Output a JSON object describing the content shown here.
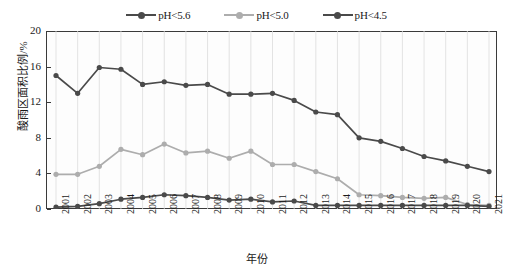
{
  "chart_data": {
    "type": "line",
    "title": "",
    "xlabel": "年份",
    "ylabel": "酸雨区面积比例/%",
    "categories": [
      "2001",
      "2002",
      "2003",
      "2004",
      "2005",
      "2006",
      "2007",
      "2008",
      "2009",
      "2010",
      "2011",
      "2012",
      "2013",
      "2014",
      "2015",
      "2016",
      "2017",
      "2018",
      "2019",
      "2020",
      "2021"
    ],
    "ylim": [
      0,
      20
    ],
    "yticks": [
      0,
      4,
      8,
      12,
      16,
      20
    ],
    "grid": "vertical-only",
    "legend_position": "top-center",
    "series": [
      {
        "name": "pH<5.6",
        "color": "#4a4a4a",
        "values": [
          15.0,
          13.0,
          15.9,
          15.7,
          14.0,
          14.3,
          13.9,
          14.0,
          12.9,
          12.9,
          13.0,
          12.2,
          10.9,
          10.6,
          8.0,
          7.6,
          6.8,
          5.9,
          5.4,
          4.8,
          4.2
        ]
      },
      {
        "name": "pH<5.0",
        "color": "#adadad",
        "values": [
          3.9,
          3.9,
          4.8,
          6.7,
          6.1,
          7.3,
          6.3,
          6.5,
          5.7,
          6.5,
          5.0,
          5.0,
          4.2,
          3.4,
          1.6,
          1.5,
          1.3,
          1.2,
          1.3,
          0.5,
          0.4
        ]
      },
      {
        "name": "pH<4.5",
        "color": "#4a4a4a",
        "values": [
          0.2,
          0.3,
          0.6,
          1.1,
          1.3,
          1.6,
          1.5,
          1.3,
          1.0,
          1.1,
          0.8,
          0.9,
          0.4,
          0.4,
          0.4,
          0.4,
          0.4,
          0.4,
          0.4,
          0.4,
          0.3
        ]
      }
    ]
  },
  "axis": {
    "y_label": "酸雨区面积比例/%",
    "x_label": "年份",
    "y_ticks": [
      "0",
      "4",
      "8",
      "12",
      "16",
      "20"
    ],
    "x_ticks": [
      "2001",
      "2002",
      "2003",
      "2004",
      "2005",
      "2006",
      "2007",
      "2008",
      "2009",
      "2010",
      "2011",
      "2012",
      "2013",
      "2014",
      "2015",
      "2016",
      "2017",
      "2018",
      "2019",
      "2020",
      "2021"
    ]
  },
  "legend": {
    "items": [
      {
        "label": "pH<5.6",
        "color": "#4a4a4a"
      },
      {
        "label": "pH<5.0",
        "color": "#adadad"
      },
      {
        "label": "pH<4.5",
        "color": "#4a4a4a"
      }
    ]
  },
  "colors": {
    "frame": "#3a3a3a",
    "gridline": "#dcdcdc",
    "plot_background": "#fdfdfd",
    "page_background": "#ffffff"
  }
}
